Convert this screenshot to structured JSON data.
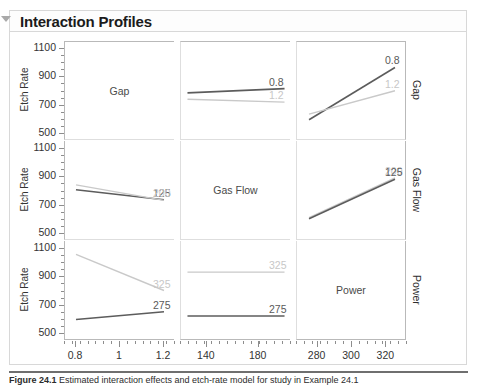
{
  "header": {
    "title": "Interaction Profiles",
    "disclosure_icon": "triangle-down-icon",
    "expanded": true
  },
  "axes": {
    "y_title": "Etch Rate",
    "y_ticks": [
      "1100",
      "900",
      "700",
      "500"
    ],
    "y_ticks_numeric": [
      1100,
      900,
      700,
      500
    ],
    "y_min": 450,
    "y_max": 1150,
    "row_right_labels": [
      "Gap",
      "Gas Flow",
      "Power"
    ],
    "columns": [
      {
        "name": "Gap",
        "ticks": [
          "0.8",
          "1",
          "1.2"
        ],
        "ticks_numeric": [
          0.8,
          1.0,
          1.2
        ],
        "min": 0.75,
        "max": 1.25
      },
      {
        "name": "Gas Flow",
        "ticks": [
          "140",
          "180"
        ],
        "ticks_numeric": [
          140,
          180
        ],
        "min": 120,
        "max": 205
      },
      {
        "name": "Power",
        "ticks": [
          "280",
          "300",
          "320"
        ],
        "ticks_numeric": [
          280,
          300,
          320
        ],
        "min": 268,
        "max": 332
      }
    ]
  },
  "colors": {
    "line_dark": "#5c5c5c",
    "line_light": "#c9c9c9",
    "grid": "#dedede",
    "frame": "#b9b9b9",
    "text": "#333333",
    "diag_text": "#4a4a4a",
    "title_text": "#1b1b1b",
    "panel_border": "#d8d8d8"
  },
  "caption": {
    "label": "Figure 24.1",
    "text": "Estimated interaction effects and etch-rate model for study in Example 24.1"
  },
  "chart_data": {
    "type": "line",
    "title": "Interaction Profiles",
    "ylabel": "Etch Rate",
    "xlabel": "",
    "ylim": [
      450,
      1150
    ],
    "grid": true,
    "legend_position": "inline-right",
    "factors": [
      "Gap",
      "Gas Flow",
      "Power"
    ],
    "panels": [
      {
        "row": 0,
        "col": 0,
        "kind": "diagonal",
        "label": "Gap",
        "x_factor": "Gap",
        "trace_factor": "Gap"
      },
      {
        "row": 0,
        "col": 1,
        "kind": "interaction",
        "x_factor": "Gas Flow",
        "trace_factor": "Gap",
        "series": [
          {
            "name": "0.8",
            "style": "dark",
            "x": [
              125,
              200
            ],
            "values": [
              790,
              820
            ],
            "label": "0.8"
          },
          {
            "name": "1.2",
            "style": "light",
            "x": [
              125,
              200
            ],
            "values": [
              745,
              725
            ],
            "label": "1.2"
          }
        ]
      },
      {
        "row": 0,
        "col": 2,
        "kind": "interaction",
        "x_factor": "Power",
        "trace_factor": "Gap",
        "series": [
          {
            "name": "0.8",
            "style": "dark",
            "x": [
              275,
              325
            ],
            "values": [
              600,
              970
            ],
            "label": "0.8"
          },
          {
            "name": "1.2",
            "style": "light",
            "x": [
              275,
              325
            ],
            "values": [
              640,
              805
            ],
            "label": "1.2"
          }
        ]
      },
      {
        "row": 1,
        "col": 0,
        "kind": "interaction",
        "x_factor": "Gap",
        "trace_factor": "Gas Flow",
        "series": [
          {
            "name": "125",
            "style": "dark",
            "x": [
              0.8,
              1.2
            ],
            "values": [
              805,
              735
            ],
            "label": "125"
          },
          {
            "name": "200",
            "style": "light",
            "x": [
              0.8,
              1.2
            ],
            "values": [
              840,
              730
            ],
            "label": "200"
          }
        ]
      },
      {
        "row": 1,
        "col": 1,
        "kind": "diagonal",
        "label": "Gas Flow",
        "x_factor": "Gas Flow",
        "trace_factor": "Gas Flow"
      },
      {
        "row": 1,
        "col": 2,
        "kind": "interaction",
        "x_factor": "Power",
        "trace_factor": "Gas Flow",
        "series": [
          {
            "name": "200",
            "style": "light",
            "x": [
              275,
              325
            ],
            "values": [
              608,
              890
            ],
            "label": "200"
          },
          {
            "name": "125",
            "style": "dark",
            "x": [
              275,
              325
            ],
            "values": [
              600,
              880
            ],
            "label": "125"
          }
        ]
      },
      {
        "row": 2,
        "col": 0,
        "kind": "interaction",
        "x_factor": "Gap",
        "trace_factor": "Power",
        "series": [
          {
            "name": "325",
            "style": "light",
            "x": [
              0.8,
              1.2
            ],
            "values": [
              1055,
              800
            ],
            "label": "325"
          },
          {
            "name": "275",
            "style": "dark",
            "x": [
              0.8,
              1.2
            ],
            "values": [
              595,
              650
            ],
            "label": "275"
          }
        ]
      },
      {
        "row": 2,
        "col": 1,
        "kind": "interaction",
        "x_factor": "Gas Flow",
        "trace_factor": "Power",
        "series": [
          {
            "name": "325",
            "style": "light",
            "x": [
              125,
              200
            ],
            "values": [
              930,
              930
            ],
            "label": "325"
          },
          {
            "name": "275",
            "style": "dark",
            "x": [
              125,
              200
            ],
            "values": [
              620,
              620
            ],
            "label": "275"
          }
        ]
      },
      {
        "row": 2,
        "col": 2,
        "kind": "diagonal",
        "label": "Power",
        "x_factor": "Power",
        "trace_factor": "Power"
      }
    ]
  }
}
